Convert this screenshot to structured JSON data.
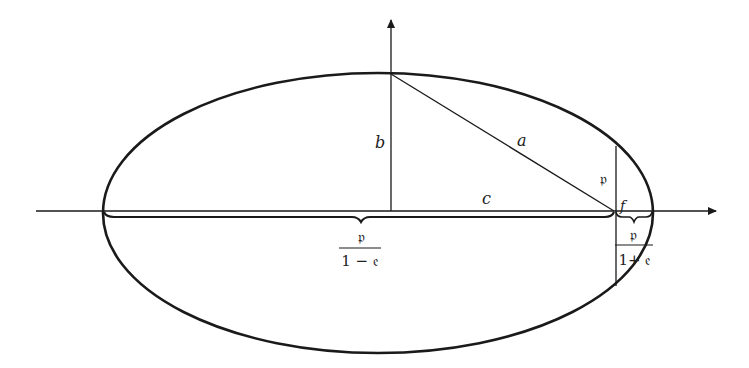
{
  "diagram": {
    "labels": {
      "semi_minor": "b",
      "semi_major": "a",
      "focal_distance": "c",
      "focus": "f",
      "semi_latus_rectum": "𝔭",
      "left_fraction_numerator": "𝔭",
      "left_fraction_denominator": "1 − 𝔢",
      "right_fraction_numerator": "𝔭",
      "right_fraction_denominator": "1+ 𝔢"
    },
    "colors": {
      "stroke": "#1a1a1a",
      "background": "#ffffff"
    }
  }
}
